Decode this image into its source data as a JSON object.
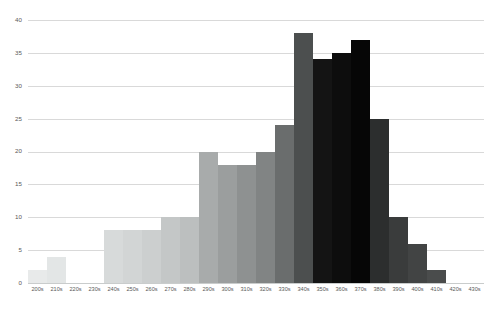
{
  "chart_data": {
    "type": "bar",
    "title": "",
    "subtitle": "",
    "xlabel": "",
    "ylabel": "",
    "grid": true,
    "legend": "none",
    "xlim": [
      "200s",
      "430s"
    ],
    "ylim": [
      0,
      40
    ],
    "y_ticks": [
      0,
      5,
      10,
      15,
      20,
      25,
      30,
      35,
      40
    ],
    "y_tick_labels": [
      "0",
      "5",
      "10",
      "15",
      "20",
      "25",
      "30",
      "35",
      "40"
    ],
    "categories": [
      "200s",
      "210s",
      "220s",
      "230s",
      "240s",
      "250s",
      "260s",
      "270s",
      "280s",
      "290s",
      "300s",
      "310s",
      "320s",
      "330s",
      "340s",
      "350s",
      "360s",
      "370s",
      "380s",
      "390s",
      "400s",
      "410s",
      "420s",
      "430s"
    ],
    "values": [
      2,
      4,
      0,
      0,
      8,
      8,
      8,
      10,
      10,
      20,
      18,
      18,
      20,
      24,
      38,
      34,
      35,
      37,
      25,
      10,
      6,
      2,
      0,
      0
    ],
    "bar_colors": [
      "#e8eaea",
      "#e3e6e6",
      "#e0e3e3",
      "#dcdfdf",
      "#d7dada",
      "#d2d5d5",
      "#cccfcf",
      "#c4c7c7",
      "#bcbfbf",
      "#a8abab",
      "#9b9e9e",
      "#8e9191",
      "#818484",
      "#6a6d6d",
      "#4c4f4f",
      "#141414",
      "#0d0d0d",
      "#060606",
      "#2c2e2e",
      "#3a3c3c",
      "#424444",
      "#4a4c4c",
      "#525454",
      "#5a5c5c"
    ],
    "gridline_color": "#d9d9d9",
    "tick_label_color": "#595959",
    "background_color": "#ffffff"
  }
}
